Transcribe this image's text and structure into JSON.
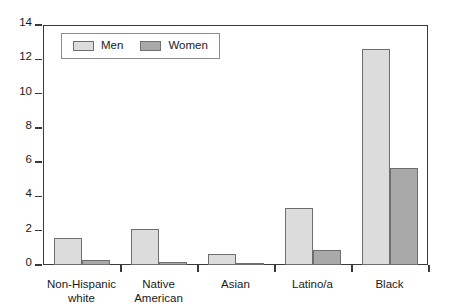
{
  "chart_data": {
    "type": "bar",
    "title": "",
    "xlabel": "",
    "ylabel": "",
    "categories": [
      "Non-Hispanic white",
      "Native American",
      "Asian",
      "Latino/a",
      "Black"
    ],
    "category_lines": [
      [
        "Non-Hispanic",
        "white"
      ],
      [
        "Native",
        "American"
      ],
      [
        "Asian",
        ""
      ],
      [
        "Latino/a",
        ""
      ],
      [
        "Black",
        ""
      ]
    ],
    "series": [
      {
        "name": "Men",
        "color": "#dcdcdc",
        "values": [
          1.6,
          2.1,
          0.65,
          3.3,
          12.6
        ]
      },
      {
        "name": "Women",
        "color": "#a9a9a9",
        "values": [
          0.3,
          0.15,
          0.1,
          0.85,
          5.65
        ]
      }
    ],
    "ylim": [
      0,
      14
    ],
    "yticks": [
      0,
      2,
      4,
      6,
      8,
      10,
      12,
      14
    ],
    "ytick_labels": [
      "0",
      "2",
      "4",
      "6",
      "8",
      "10",
      "12",
      "14"
    ],
    "grid": false,
    "legend_position": "top-left",
    "legend_entries": [
      "Men",
      "Women"
    ]
  },
  "legend": {
    "men_label": "Men",
    "women_label": "Women"
  }
}
